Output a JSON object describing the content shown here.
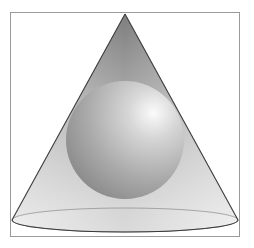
{
  "diagram": {
    "frame": {
      "x": 10,
      "y": 12,
      "width": 230,
      "height": 225,
      "stroke": "#9a9a9a"
    },
    "cone": {
      "apex": {
        "x": 125,
        "y": 14
      },
      "base_center": {
        "x": 125,
        "y": 220
      },
      "base_rx": 113,
      "base_ry": 12,
      "edge_color": "#3a3a3a",
      "fill_dark": "#8e8e8e",
      "fill_light": "#e6e6e6"
    },
    "sphere": {
      "center": {
        "x": 125,
        "y": 140
      },
      "radius": 59,
      "highlight": {
        "x": 153,
        "y": 112
      },
      "color_light": "#f7f7f7",
      "color_dark": "#8a8a8a"
    }
  }
}
